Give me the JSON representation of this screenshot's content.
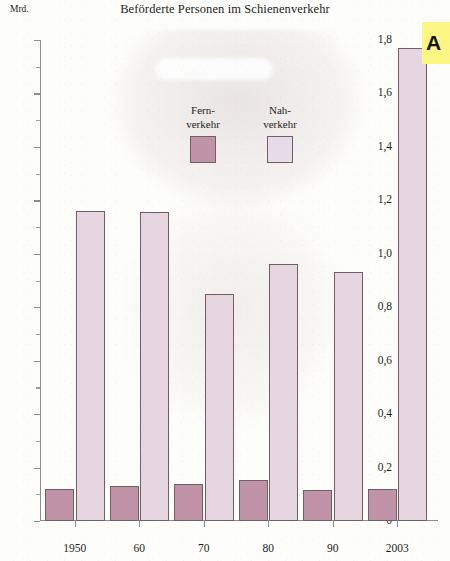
{
  "chart_data": {
    "type": "bar",
    "title": "Beförderte Personen im Schienenverkehr",
    "ylabel": "Mrd.",
    "xlabel": "",
    "ylim": [
      0,
      1.8
    ],
    "ytick_labels": [
      "1,8",
      "1,6",
      "1,4",
      "1,2",
      "1,0",
      "0,8",
      "0,6",
      "0,4",
      "0,2",
      "0"
    ],
    "ytick_values": [
      1.8,
      1.6,
      1.4,
      1.2,
      1.0,
      0.8,
      0.6,
      0.4,
      0.2,
      0
    ],
    "minor_tick_step": 0.1,
    "grid": false,
    "legend_position": "inside-top-center",
    "categories": [
      "1950",
      "60",
      "70",
      "80",
      "90",
      "2003"
    ],
    "series": [
      {
        "name": "Fern-\nverkehr",
        "color": "#c093a8",
        "values": [
          0.12,
          0.13,
          0.14,
          0.155,
          0.115,
          0.12
        ]
      },
      {
        "name": "Nah-\nverkehr",
        "color": "#e6d6e1",
        "values": [
          1.16,
          1.155,
          0.85,
          0.96,
          0.93,
          1.77
        ]
      }
    ]
  },
  "header": {
    "title": "Beförderte Personen im Schienenverkehr",
    "unit": "Mrd."
  },
  "legend": {
    "items": [
      {
        "line1": "Fern-",
        "line2": "verkehr",
        "color": "#c093a8"
      },
      {
        "line1": "Nah-",
        "line2": "verkehr",
        "color": "#e9dcea"
      }
    ]
  },
  "corner_tag": {
    "text": "A",
    "background": "#fcf683"
  }
}
